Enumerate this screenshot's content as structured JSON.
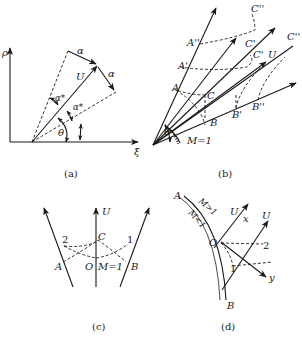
{
  "panels": {
    "a": {
      "caption": "(a)",
      "axis_y": "ρ",
      "axis_x": "ξ",
      "labels": {
        "U": "U",
        "alpha1": "α",
        "alpha2": "α",
        "alpha_star1": "α*",
        "alpha_star2": "α*",
        "theta": "θ"
      }
    },
    "b": {
      "caption": "(b)",
      "labels": {
        "C2top": "C''",
        "A2": "A''",
        "C1top": "C'",
        "C1mid": "C'",
        "C2right": "C''",
        "A1": "A'",
        "U": "U",
        "A": "A",
        "C": "C",
        "B": "B",
        "B1": "B'",
        "B2": "B''",
        "theta": "θ",
        "M1": "M=1"
      }
    },
    "c": {
      "caption": "(c)",
      "labels": {
        "U": "U",
        "C": "C",
        "two": "2",
        "one": "1",
        "A": "A",
        "O": "O",
        "M1": "M=1",
        "B": "B"
      }
    },
    "d": {
      "caption": "(d)",
      "labels": {
        "A": "A",
        "Mgt": "M>1",
        "Mlt": "M<1",
        "U1": "U",
        "x": "x",
        "U2": "U",
        "O": "O",
        "two": "2",
        "one": "1",
        "y": "y",
        "B": "B"
      }
    }
  }
}
